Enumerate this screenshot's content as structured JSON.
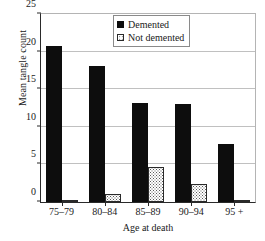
{
  "chart_data": {
    "type": "bar",
    "title": "",
    "xlabel": "Age at death",
    "ylabel": "Mean tangle count",
    "categories": [
      "75–79",
      "80–84",
      "85–89",
      "90–94",
      "95 +"
    ],
    "series": [
      {
        "name": "Demented",
        "values": [
          20.8,
          18.1,
          13.2,
          13.0,
          7.7
        ]
      },
      {
        "name": "Not demented",
        "values": [
          0.1,
          1.0,
          4.6,
          2.4,
          0.3
        ]
      }
    ],
    "ylim": [
      0,
      25
    ],
    "yticks": [
      0,
      5,
      10,
      15,
      20,
      25
    ],
    "ytick_labels": [
      "0",
      "5",
      "10",
      "15",
      "20",
      "25"
    ],
    "grid": true,
    "legend_position": "top-right",
    "colors": {
      "demented": "#0d0d0d",
      "not_demented_fill": "#ffffff",
      "not_demented_dots": "#5a5a5a",
      "axis": "#2a2a2a",
      "grid": "#c0c0c0",
      "background": "#ffffff"
    }
  },
  "legend": {
    "items": [
      {
        "label": "Demented",
        "swatch": "solid-black-square-icon"
      },
      {
        "label": "Not demented",
        "swatch": "dotted-square-icon"
      }
    ]
  }
}
